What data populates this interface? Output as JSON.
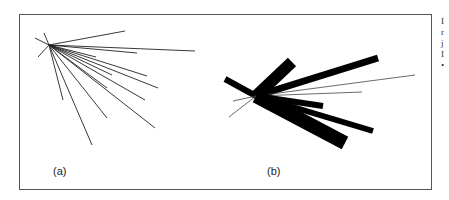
{
  "figure": {
    "panels": [
      {
        "label": "(a)",
        "type": "line-star",
        "center": [
          49,
          45
        ],
        "lines": [
          [
            35,
            38
          ],
          [
            44,
            33
          ],
          [
            38,
            57
          ],
          [
            125,
            31
          ],
          [
            195,
            51
          ],
          [
            137,
            53
          ],
          [
            96,
            57
          ],
          [
            112,
            75
          ],
          [
            147,
            76
          ],
          [
            158,
            88
          ],
          [
            107,
            88
          ],
          [
            145,
            100
          ],
          [
            155,
            128
          ],
          [
            107,
            118
          ],
          [
            92,
            145
          ],
          [
            63,
            100
          ]
        ]
      },
      {
        "label": "(b)",
        "type": "weighted-bar-star",
        "center": [
          256,
          96
        ],
        "bars": [
          {
            "to": [
              225,
              79
            ],
            "width": 6
          },
          {
            "to": [
              292,
              62
            ],
            "width": 12
          },
          {
            "to": [
              378,
              58
            ],
            "width": 7
          },
          {
            "to": [
              415,
              75
            ],
            "width": 1
          },
          {
            "to": [
              362,
              92
            ],
            "width": 1
          },
          {
            "to": [
              323,
              106
            ],
            "width": 6
          },
          {
            "to": [
              373,
              131
            ],
            "width": 6
          },
          {
            "to": [
              345,
              143
            ],
            "width": 14
          },
          {
            "to": [
              229,
              117
            ],
            "width": 1
          },
          {
            "to": [
              233,
              101
            ],
            "width": 1
          }
        ]
      }
    ],
    "edge_text_fragments": [
      "I",
      "r",
      "j",
      "I",
      "•"
    ]
  }
}
